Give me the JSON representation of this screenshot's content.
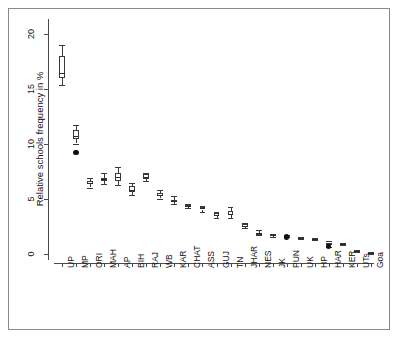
{
  "figure": {
    "title": "",
    "ylabel": "Relative schools frequency in %",
    "xlabel": ""
  },
  "axes": {
    "y_ticks": [
      "0",
      "5",
      "10",
      "15",
      "20"
    ],
    "y_tick_values": [
      0,
      5,
      10,
      15,
      20
    ],
    "x_ticks": [
      "UP",
      "MP",
      "ORI",
      "MAH",
      "AP",
      "BIH",
      "RAJ",
      "WB",
      "KAR",
      "CHAT",
      "ASS",
      "GUJ",
      "TN",
      "JHAR",
      "NES",
      "JK",
      "PUN",
      "UK",
      "HP",
      "HAR",
      "KER",
      "UTs",
      "Goa"
    ]
  },
  "colors": {
    "line": "#3a3a3a",
    "box_fill": "#ffffff",
    "outlier": "#111111",
    "frame": "#8a8a8a",
    "background": "#ffffff"
  },
  "chart_data": {
    "type": "box",
    "title": "",
    "xlabel": "",
    "ylabel": "Relative schools frequency in %",
    "ylim": [
      -0.6,
      21.5
    ],
    "grid": false,
    "legend": "none",
    "categories": [
      "UP",
      "MP",
      "ORI",
      "MAH",
      "AP",
      "BIH",
      "RAJ",
      "WB",
      "KAR",
      "CHAT",
      "ASS",
      "GUJ",
      "TN",
      "JHAR",
      "NES",
      "JK",
      "PUN",
      "UK",
      "HP",
      "HAR",
      "KER",
      "UTs",
      "Goa"
    ],
    "boxes": [
      {
        "label": "UP",
        "whisker_low": 15.3,
        "q1": 16.0,
        "median": 16.4,
        "q3": 18.0,
        "whisker_high": 19.0,
        "outliers": []
      },
      {
        "label": "MP",
        "whisker_low": 10.0,
        "q1": 10.4,
        "median": 10.7,
        "q3": 11.2,
        "whisker_high": 11.7,
        "outliers": [
          9.2
        ]
      },
      {
        "label": "ORI",
        "whisker_low": 6.0,
        "q1": 6.3,
        "median": 6.4,
        "q3": 6.6,
        "whisker_high": 6.9,
        "outliers": []
      },
      {
        "label": "MAH",
        "whisker_low": 6.3,
        "q1": 6.6,
        "median": 6.8,
        "q3": 6.9,
        "whisker_high": 7.3,
        "outliers": []
      },
      {
        "label": "AP",
        "whisker_low": 6.2,
        "q1": 6.6,
        "median": 7.0,
        "q3": 7.3,
        "whisker_high": 7.9,
        "outliers": []
      },
      {
        "label": "BIH",
        "whisker_low": 5.3,
        "q1": 5.6,
        "median": 5.8,
        "q3": 6.1,
        "whisker_high": 6.4,
        "outliers": []
      },
      {
        "label": "RAJ",
        "whisker_low": 6.6,
        "q1": 6.8,
        "median": 7.0,
        "q3": 7.2,
        "whisker_high": 7.3,
        "outliers": []
      },
      {
        "label": "WB",
        "whisker_low": 5.0,
        "q1": 5.2,
        "median": 5.3,
        "q3": 5.5,
        "whisker_high": 5.8,
        "outliers": []
      },
      {
        "label": "KAR",
        "whisker_low": 4.5,
        "q1": 4.7,
        "median": 4.8,
        "q3": 4.9,
        "whisker_high": 5.2,
        "outliers": []
      },
      {
        "label": "CHAT",
        "whisker_low": 4.1,
        "q1": 4.2,
        "median": 4.3,
        "q3": 4.4,
        "whisker_high": 4.5,
        "outliers": []
      },
      {
        "label": "ASS",
        "whisker_low": 3.8,
        "q1": 4.0,
        "median": 4.1,
        "q3": 4.2,
        "whisker_high": 4.3,
        "outliers": []
      },
      {
        "label": "GUJ",
        "whisker_low": 3.2,
        "q1": 3.4,
        "median": 3.5,
        "q3": 3.7,
        "whisker_high": 3.8,
        "outliers": []
      },
      {
        "label": "TN",
        "whisker_low": 3.2,
        "q1": 3.5,
        "median": 3.6,
        "q3": 3.9,
        "whisker_high": 4.2,
        "outliers": []
      },
      {
        "label": "JHAR",
        "whisker_low": 2.3,
        "q1": 2.4,
        "median": 2.5,
        "q3": 2.7,
        "whisker_high": 2.8,
        "outliers": []
      },
      {
        "label": "NES",
        "whisker_low": 1.7,
        "q1": 1.8,
        "median": 1.9,
        "q3": 1.9,
        "whisker_high": 2.1,
        "outliers": []
      },
      {
        "label": "JK",
        "whisker_low": 1.5,
        "q1": 1.6,
        "median": 1.7,
        "q3": 1.8,
        "whisker_high": 1.8,
        "outliers": []
      },
      {
        "label": "PUN",
        "whisker_low": 1.5,
        "q1": 1.5,
        "median": 1.6,
        "q3": 1.6,
        "whisker_high": 1.7,
        "outliers": [
          1.5
        ]
      },
      {
        "label": "UK",
        "whisker_low": 1.3,
        "q1": 1.4,
        "median": 1.4,
        "q3": 1.4,
        "whisker_high": 1.5,
        "outliers": []
      },
      {
        "label": "HP",
        "whisker_low": 1.2,
        "q1": 1.3,
        "median": 1.3,
        "q3": 1.4,
        "whisker_high": 1.4,
        "outliers": []
      },
      {
        "label": "HAR",
        "whisker_low": 0.6,
        "q1": 0.8,
        "median": 0.9,
        "q3": 1.0,
        "whisker_high": 1.1,
        "outliers": [
          0.65
        ]
      },
      {
        "label": "KER",
        "whisker_low": 0.8,
        "q1": 0.9,
        "median": 0.9,
        "q3": 1.0,
        "whisker_high": 1.0,
        "outliers": []
      },
      {
        "label": "UTs",
        "whisker_low": 0.1,
        "q1": 0.2,
        "median": 0.2,
        "q3": 0.3,
        "whisker_high": 0.3,
        "outliers": []
      },
      {
        "label": "Goa",
        "whisker_low": 0.0,
        "q1": 0.0,
        "median": 0.05,
        "q3": 0.1,
        "whisker_high": 0.1,
        "outliers": []
      }
    ]
  }
}
